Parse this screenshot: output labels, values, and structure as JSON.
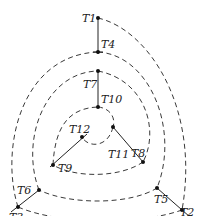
{
  "diagram": {
    "points": [
      {
        "id": "T1",
        "label": "T1",
        "x": 98,
        "y": 18
      },
      {
        "id": "T2",
        "label": "T2",
        "x": 182,
        "y": 210
      },
      {
        "id": "T3",
        "label": "T3",
        "x": 18,
        "y": 207
      },
      {
        "id": "T4",
        "label": "T4",
        "x": 98,
        "y": 52
      },
      {
        "id": "T5",
        "label": "T5",
        "x": 157,
        "y": 188
      },
      {
        "id": "T6",
        "label": "T6",
        "x": 39,
        "y": 190
      },
      {
        "id": "T7",
        "label": "T7",
        "x": 98,
        "y": 71
      },
      {
        "id": "T8",
        "label": "T8",
        "x": 143,
        "y": 162
      },
      {
        "id": "T9",
        "label": "T9",
        "x": 53,
        "y": 165
      },
      {
        "id": "T10",
        "label": "T10",
        "x": 98,
        "y": 107
      },
      {
        "id": "T11",
        "label": "T11",
        "x": 113,
        "y": 127
      },
      {
        "id": "T12",
        "label": "T12",
        "x": 82,
        "y": 137
      }
    ],
    "solid_edges": [
      [
        "T1",
        "T4"
      ],
      [
        "T7",
        "T10"
      ],
      [
        "T3",
        "T6"
      ],
      [
        "T9",
        "T12"
      ],
      [
        "T2",
        "T5"
      ],
      [
        "T8",
        "T11"
      ]
    ],
    "dashed_arcs": [
      [
        "T1",
        "T2"
      ],
      [
        "T2",
        "T3"
      ],
      [
        "T3",
        "T4"
      ],
      [
        "T4",
        "T5"
      ],
      [
        "T5",
        "T6"
      ],
      [
        "T6",
        "T7"
      ],
      [
        "T7",
        "T8"
      ],
      [
        "T8",
        "T9"
      ],
      [
        "T9",
        "T10"
      ],
      [
        "T10",
        "T11"
      ],
      [
        "T11",
        "T12"
      ]
    ]
  }
}
